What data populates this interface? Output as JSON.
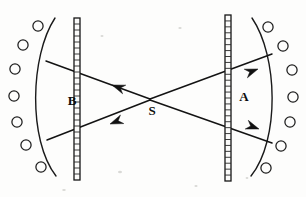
{
  "figure": {
    "background_color": "#fdfdfc",
    "ink_color": "#131313",
    "width": 306,
    "height": 197
  },
  "labels": {
    "source": "S",
    "left_focus": "B",
    "right_focus": "A"
  },
  "label_positions": {
    "source": {
      "x": 152,
      "y": 115
    },
    "left_focus": {
      "x": 72,
      "y": 105
    },
    "right_focus": {
      "x": 244,
      "y": 101
    }
  },
  "barriers": [
    {
      "name": "left-barrier",
      "x": 77,
      "top": 18,
      "bottom": 180,
      "width": 6,
      "hatch_count": 27
    },
    {
      "name": "right-barrier",
      "x": 228,
      "top": 15,
      "bottom": 181,
      "width": 6,
      "hatch_count": 28
    }
  ],
  "screens": [
    {
      "name": "left-screen-arc",
      "path": "M 55 18 C 30 56, 28 140, 56 176",
      "bulge": "left"
    },
    {
      "name": "right-screen-arc",
      "path": "M 252 18 C 278 56, 280 140, 251 176",
      "bulge": "right"
    }
  ],
  "detectors_left": [
    {
      "cx": 38,
      "cy": 26,
      "r": 5.1
    },
    {
      "cx": 23,
      "cy": 45,
      "r": 5.1
    },
    {
      "cx": 15,
      "cy": 69,
      "r": 5.1
    },
    {
      "cx": 14,
      "cy": 96,
      "r": 5.1
    },
    {
      "cx": 17,
      "cy": 122,
      "r": 5.1
    },
    {
      "cx": 26,
      "cy": 145,
      "r": 5.1
    },
    {
      "cx": 41,
      "cy": 167,
      "r": 5.1
    }
  ],
  "detectors_right": [
    {
      "cx": 268,
      "cy": 27,
      "r": 5.1
    },
    {
      "cx": 283,
      "cy": 46,
      "r": 5.1
    },
    {
      "cx": 292,
      "cy": 70,
      "r": 5.1
    },
    {
      "cx": 293,
      "cy": 97,
      "r": 5.1
    },
    {
      "cx": 290,
      "cy": 122,
      "r": 5.1
    },
    {
      "cx": 281,
      "cy": 146,
      "r": 5.1
    },
    {
      "cx": 266,
      "cy": 168,
      "r": 5.1
    }
  ],
  "rays": [
    {
      "name": "ray-upper-left",
      "from": {
        "x": 150,
        "y": 99
      },
      "to": {
        "x": 46,
        "y": 61
      },
      "arrow_at": {
        "x": 112,
        "y": 85
      },
      "direction": "left-up"
    },
    {
      "name": "ray-lower-left",
      "from": {
        "x": 150,
        "y": 100
      },
      "to": {
        "x": 47,
        "y": 140
      },
      "arrow_at": {
        "x": 110,
        "y": 124
      },
      "direction": "left-down"
    },
    {
      "name": "ray-upper-right",
      "from": {
        "x": 150,
        "y": 99
      },
      "to": {
        "x": 272,
        "y": 54
      },
      "arrow_at": {
        "x": 258,
        "y": 69
      },
      "direction": "right-up"
    },
    {
      "name": "ray-lower-right",
      "from": {
        "x": 150,
        "y": 100
      },
      "to": {
        "x": 272,
        "y": 143
      },
      "arrow_at": {
        "x": 259,
        "y": 129
      },
      "direction": "right-down"
    }
  ],
  "specks": [
    {
      "cx": 120,
      "cy": 172,
      "rx": 2.0,
      "ry": 1.2
    },
    {
      "cx": 196,
      "cy": 186,
      "rx": 1.6,
      "ry": 1.0
    },
    {
      "cx": 64,
      "cy": 190,
      "rx": 1.8,
      "ry": 1.1
    },
    {
      "cx": 247,
      "cy": 178,
      "rx": 1.4,
      "ry": 0.9
    },
    {
      "cx": 102,
      "cy": 36,
      "rx": 1.5,
      "ry": 1.0
    },
    {
      "cx": 180,
      "cy": 28,
      "rx": 1.7,
      "ry": 1.0
    }
  ]
}
